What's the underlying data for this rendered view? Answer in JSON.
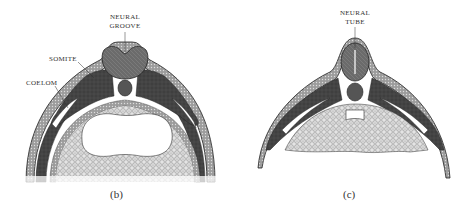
{
  "panels": [
    {
      "id": "b",
      "caption": "(b)",
      "labels": {
        "neural_groove_line1": "NEURAL",
        "neural_groove_line2": "GROOVE",
        "somite": "SOMITE",
        "coelom": "COELOM"
      }
    },
    {
      "id": "c",
      "caption": "(c)",
      "labels": {
        "neural_tube_line1": "NEURAL",
        "neural_tube_line2": "TUBE"
      }
    }
  ],
  "colors": {
    "ectoderm": "#9a9a9a",
    "mesoderm_dark": "#3c3c3c",
    "neural": "#6a6a6a",
    "notochord": "#555555",
    "yolk": "#d8d8d8",
    "outline": "#222222",
    "label_text": "#333333"
  }
}
